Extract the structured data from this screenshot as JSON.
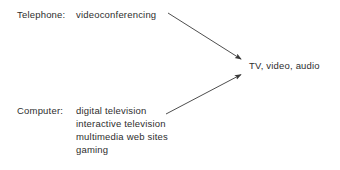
{
  "diagram": {
    "type": "convergence-diagram",
    "background_color": "#ffffff",
    "text_color": "#2e2e2e",
    "arrow_color": "#3a3a3a",
    "source_groups": [
      {
        "id": "telephone",
        "label": "Telephone:",
        "items": [
          "videoconferencing"
        ]
      },
      {
        "id": "computer",
        "label": "Computer:",
        "items": [
          "digital television",
          "interactive television",
          "multimedia web sites",
          "gaming"
        ]
      }
    ],
    "target": {
      "id": "convergence-target",
      "label": "TV, video, audio"
    },
    "arrows": [
      {
        "id": "telephone-to-target",
        "from": "telephone",
        "to": "convergence-target",
        "x1": 168,
        "y1": 13,
        "x2": 244,
        "y2": 61
      },
      {
        "id": "computer-to-target",
        "from": "computer",
        "to": "convergence-target",
        "x1": 166,
        "y1": 114,
        "x2": 244,
        "y2": 73
      }
    ]
  }
}
